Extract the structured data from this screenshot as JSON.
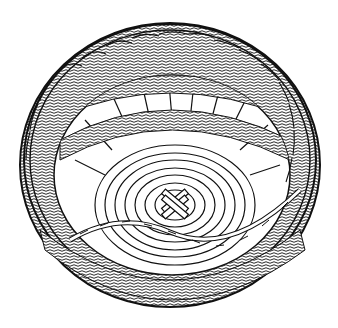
{
  "image": {
    "subject": "Line-art illustration of a round woven basket viewed from above at an angle",
    "style": "black ink on white",
    "features": [
      "braided rim",
      "woven side stakes with gaps",
      "coiled base",
      "woven cross at center of base"
    ]
  },
  "colors": {
    "background": "#ffffff",
    "ink": "#111111",
    "fill": "#ffffff",
    "shade": "#d8d8d8"
  }
}
